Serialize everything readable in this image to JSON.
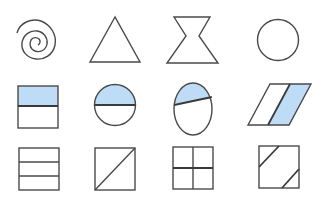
{
  "figure": {
    "colors": {
      "stroke": "#4a4a4a",
      "fill_accent": "#bfdcf7",
      "background": "#ffffff"
    },
    "rows": [
      {
        "index": 1,
        "shapes": [
          {
            "id": "spiral",
            "label": "spiral",
            "shaded": false
          },
          {
            "id": "triangle",
            "label": "triangle",
            "shaded": false
          },
          {
            "id": "hourglass",
            "label": "hourglass",
            "shaded": false
          },
          {
            "id": "circle",
            "label": "circle",
            "shaded": false
          }
        ]
      },
      {
        "index": 2,
        "shapes": [
          {
            "id": "square-half-shaded",
            "label": "square with top half shaded",
            "shaded": true,
            "parts": 2,
            "shaded_parts": 1
          },
          {
            "id": "circle-half-shaded",
            "label": "circle with top half shaded",
            "shaded": true,
            "parts": 2,
            "shaded_parts": 1
          },
          {
            "id": "oval-unequal-shaded",
            "label": "oval split by slanted line, top part shaded",
            "shaded": true,
            "parts": 2,
            "shaded_parts": 1
          },
          {
            "id": "parallelogram-half-shaded",
            "label": "parallelogram with right half shaded",
            "shaded": true,
            "parts": 2,
            "shaded_parts": 1
          }
        ]
      },
      {
        "index": 3,
        "shapes": [
          {
            "id": "square-thirds",
            "label": "square divided into 3 horizontal strips",
            "shaded": false,
            "parts": 3
          },
          {
            "id": "square-diagonal",
            "label": "square divided by diagonal",
            "shaded": false,
            "parts": 2
          },
          {
            "id": "square-quarters",
            "label": "square divided into 4 quarters",
            "shaded": false,
            "parts": 4
          },
          {
            "id": "square-corner-cuts",
            "label": "square with two corner cuts",
            "shaded": false,
            "parts": 3
          }
        ]
      }
    ]
  }
}
